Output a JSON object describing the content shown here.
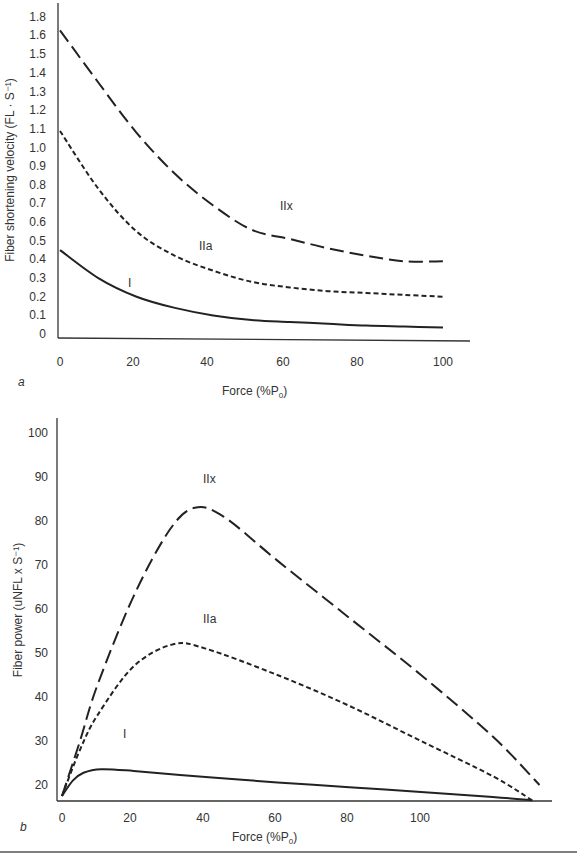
{
  "chart_data": [
    {
      "panel": "a",
      "type": "line",
      "title": "",
      "xlabel": "Force (%P0)",
      "ylabel": "Fiber shortening velocity (FL · S⁻¹)",
      "x_ticks": [
        "0",
        "20",
        "40",
        "60",
        "80",
        "100"
      ],
      "y_ticks": [
        "0",
        "0.1",
        "0.2",
        "0.3",
        "0.4",
        "0.5",
        "0.6",
        "0.7",
        "0.8",
        "0.9",
        "1.0",
        "1.1",
        "1.2",
        "1.3",
        "1.4",
        "1.5",
        "1.6",
        "1.8"
      ],
      "xlim": [
        0,
        105
      ],
      "ylim": [
        0,
        1.8
      ],
      "grid": false,
      "legend": "inline labels",
      "series": [
        {
          "name": "IIx",
          "style": "long-dash",
          "x": [
            0,
            10,
            20,
            30,
            40,
            50,
            60,
            70,
            80,
            90,
            100
          ],
          "y": [
            1.63,
            1.35,
            1.08,
            0.86,
            0.69,
            0.56,
            0.51,
            0.46,
            0.42,
            0.39,
            0.39
          ]
        },
        {
          "name": "IIa",
          "style": "short-dash",
          "x": [
            0,
            10,
            20,
            30,
            40,
            50,
            60,
            70,
            80,
            90,
            100
          ],
          "y": [
            1.09,
            0.78,
            0.55,
            0.42,
            0.34,
            0.28,
            0.25,
            0.23,
            0.22,
            0.21,
            0.2
          ]
        },
        {
          "name": "I",
          "style": "solid",
          "x": [
            0,
            10,
            20,
            30,
            40,
            50,
            60,
            70,
            80,
            90,
            100
          ],
          "y": [
            0.45,
            0.3,
            0.2,
            0.14,
            0.1,
            0.075,
            0.065,
            0.055,
            0.045,
            0.04,
            0.035
          ]
        }
      ],
      "annotations": [
        {
          "text": "IIx",
          "x": 62,
          "y": 0.62
        },
        {
          "text": "IIa",
          "x": 38,
          "y": 0.45
        },
        {
          "text": "I",
          "x": 19,
          "y": 0.28
        }
      ]
    },
    {
      "panel": "b",
      "type": "line",
      "title": "",
      "xlabel": "Force (%P0)",
      "ylabel": "Fiber power (uNFL x S⁻¹)",
      "x_ticks": [
        "0",
        "20",
        "40",
        "60",
        "80",
        "100"
      ],
      "y_ticks": [
        "20",
        "30",
        "40",
        "50",
        "60",
        "70",
        "80",
        "90",
        "100"
      ],
      "xlim": [
        0,
        136
      ],
      "ylim": [
        16.5,
        103
      ],
      "grid": false,
      "legend": "inline labels",
      "series": [
        {
          "name": "IIx",
          "style": "long-dash",
          "x": [
            0,
            5,
            10,
            20,
            30,
            37,
            45,
            60,
            80,
            100,
            120,
            133
          ],
          "y": [
            17.5,
            30,
            43,
            63,
            78,
            83,
            81,
            71,
            58,
            45,
            31,
            20
          ]
        },
        {
          "name": "IIa",
          "style": "short-dash",
          "x": [
            0,
            5,
            10,
            20,
            31,
            40,
            60,
            80,
            100,
            120,
            131
          ],
          "y": [
            17.5,
            28,
            36,
            47,
            52,
            51,
            45,
            38,
            30,
            22,
            16.5
          ]
        },
        {
          "name": "I",
          "style": "solid",
          "x": [
            0,
            3,
            6,
            11,
            20,
            40,
            60,
            80,
            100,
            120,
            131
          ],
          "y": [
            17.5,
            21,
            22.8,
            23.6,
            23.2,
            21.8,
            20.6,
            19.5,
            18.4,
            17.3,
            16.5
          ]
        }
      ],
      "annotations": [
        {
          "text": "IIx",
          "x": 41,
          "y": 89
        },
        {
          "text": "IIa",
          "x": 41,
          "y": 57
        },
        {
          "text": "I",
          "x": 18,
          "y": 33
        }
      ]
    }
  ],
  "panels": {
    "a": {
      "label": "a",
      "ylabel": "Fiber shortening velocity (FL · S⁻¹)",
      "xlabel_main": "Force (%P",
      "xlabel_sub": "0",
      "xlabel_end": ")",
      "ann_IIx": "IIx",
      "ann_IIa": "IIa",
      "ann_I": "I"
    },
    "b": {
      "label": "b",
      "ylabel": "Fiber power (uNFL x S⁻¹)",
      "xlabel_main": "Force (%P",
      "xlabel_sub": "0",
      "xlabel_end": ")",
      "ann_IIx": "IIx",
      "ann_IIa": "IIa",
      "ann_I": "I"
    }
  }
}
